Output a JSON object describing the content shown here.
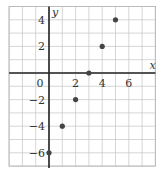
{
  "chart_data": {
    "type": "scatter",
    "title": "",
    "xlabel": "x",
    "ylabel": "y",
    "x": [
      0,
      1,
      2,
      3,
      4,
      5
    ],
    "y": [
      -6,
      -4,
      -2,
      0,
      2,
      4
    ],
    "xlim": [
      -3,
      8
    ],
    "ylim": [
      -7,
      5
    ],
    "xticks": [
      0,
      2,
      4,
      6
    ],
    "yticks": [
      4,
      2,
      -2,
      -4,
      -6
    ],
    "xtick_labels": [
      "0",
      "2",
      "4",
      "6"
    ],
    "ytick_labels": [
      "4",
      "2",
      "−2",
      "−4",
      "−6"
    ],
    "grid": true,
    "legend": null,
    "colors": {
      "grid": "#cccccc",
      "axis": "#222222",
      "point": "#444444",
      "frame": "#bbbbbb"
    }
  }
}
